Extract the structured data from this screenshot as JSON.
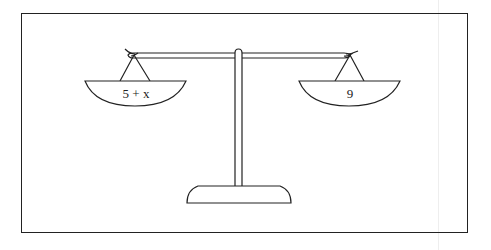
{
  "diagram": {
    "type": "balance-scale",
    "left_pan": {
      "label": "5 + x"
    },
    "right_pan": {
      "label": "9"
    },
    "colors": {
      "stroke": "#222222",
      "background": "#ffffff"
    }
  }
}
